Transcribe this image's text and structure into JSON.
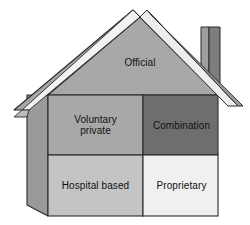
{
  "diagram": {
    "shape": "house",
    "colors": {
      "roof_left": "#a6a6a6",
      "roof_right": "#9d9d9d",
      "roof_highlight": "#f2f2f2",
      "gable": "#a8a8a8",
      "side_wall": "#9a9a9a",
      "chimney_light": "#9e9e9e",
      "chimney_dark": "#7d7d7d",
      "quadrant_voluntary": "#a8a8a8",
      "quadrant_combination": "#6e6e6e",
      "quadrant_hospital": "#c4c4c4",
      "quadrant_proprietary": "#f0f0f0",
      "outline": "#2b2b2b",
      "label_text": "#111111",
      "background": "#ffffff"
    },
    "parts": {
      "roof": "roof",
      "chimney": "chimney",
      "side_wall": "side-wall",
      "gable": "gable",
      "front_wall": "front-wall"
    },
    "gable_zone": {
      "id": "official",
      "label": "Official"
    },
    "quadrants": [
      {
        "id": "voluntary-private",
        "label": "Voluntary\nprivate",
        "position": "top-left"
      },
      {
        "id": "combination",
        "label": "Combination",
        "position": "top-right"
      },
      {
        "id": "hospital-based",
        "label": "Hospital based",
        "position": "bottom-left"
      },
      {
        "id": "proprietary",
        "label": "Proprietary",
        "position": "bottom-right"
      }
    ]
  }
}
